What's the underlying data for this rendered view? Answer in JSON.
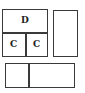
{
  "diagram": {
    "type": "layout-blocks",
    "stroke_color": "#3a3a3a",
    "blocks": [
      {
        "id": "main-block",
        "cells": [
          {
            "id": "top-cell",
            "label": "D"
          },
          {
            "id": "bottom-left-cell",
            "label": "C"
          },
          {
            "id": "bottom-right-cell",
            "label": "C"
          }
        ]
      },
      {
        "id": "right-tall-block",
        "label": ""
      },
      {
        "id": "bottom-wide-block",
        "cells": [
          {
            "id": "left-cell",
            "label": ""
          },
          {
            "id": "right-cell",
            "label": ""
          }
        ]
      }
    ]
  }
}
